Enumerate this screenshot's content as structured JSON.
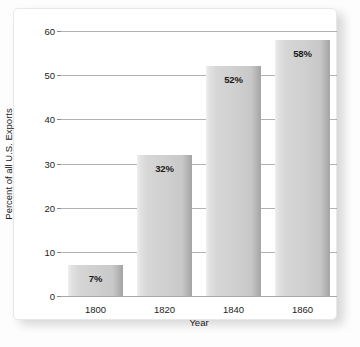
{
  "chart_data": {
    "type": "bar",
    "title": "",
    "categories": [
      "1800",
      "1820",
      "1840",
      "1860"
    ],
    "values": [
      7,
      32,
      52,
      58
    ],
    "data_labels": [
      "7%",
      "32%",
      "52%",
      "58%"
    ],
    "xlabel": "Year",
    "ylabel": "Percent of all U.S. Exports",
    "ylim": [
      0,
      60
    ],
    "ytick_labels": [
      "0",
      "10",
      "20",
      "30",
      "40",
      "50",
      "60"
    ],
    "ytick_values": [
      0,
      10,
      20,
      30,
      40,
      50,
      60
    ],
    "grid": true,
    "legend": "none",
    "colors": {
      "bar_light": "#efefef",
      "bar_mid": "#cfcfcf",
      "bar_dark": "#a4a4a4",
      "gridline": "#9a9a9a",
      "text": "#1c1c1c",
      "card_background": "#ffffff",
      "page_background": "#fdfdfd"
    }
  }
}
